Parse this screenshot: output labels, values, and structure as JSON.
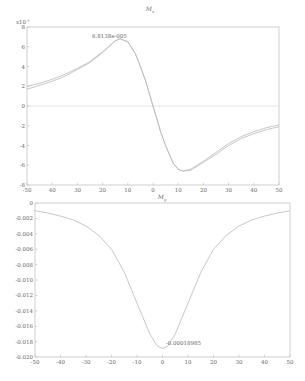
{
  "chart_data": [
    {
      "type": "line",
      "title": "M_x",
      "xlabel": "",
      "ylabel": "",
      "y_scale_label": "x10^-5",
      "xlim": [
        -50,
        50
      ],
      "ylim": [
        -8,
        8
      ],
      "x_ticks": [
        -50,
        -40,
        -30,
        -20,
        -10,
        0,
        10,
        20,
        30,
        40,
        50
      ],
      "x_tick_labels": [
        "-50",
        "40",
        "30",
        "20",
        "10",
        "0",
        "10",
        "20",
        "30",
        "40",
        "50"
      ],
      "y_ticks": [
        -8,
        -6,
        -4,
        -2,
        0,
        2,
        4,
        6,
        8
      ],
      "grid": false,
      "zero_line": true,
      "annotation": {
        "text": "6.8138e-005",
        "x": -13,
        "y": 6.8138
      },
      "series": [
        {
          "name": "curve-1",
          "x": [
            -50,
            -45,
            -40,
            -35,
            -30,
            -25,
            -20,
            -15,
            -13,
            -10,
            -7,
            -5,
            -3,
            0,
            3,
            5,
            8,
            10,
            12,
            15,
            20,
            25,
            30,
            35,
            40,
            45,
            50
          ],
          "values": [
            2.0,
            2.3,
            2.7,
            3.2,
            3.8,
            4.5,
            5.5,
            6.6,
            6.81,
            6.5,
            5.3,
            4.0,
            2.6,
            0.0,
            -2.6,
            -4.0,
            -5.8,
            -6.4,
            -6.6,
            -6.4,
            -5.6,
            -4.7,
            -3.8,
            -3.1,
            -2.6,
            -2.2,
            -1.9
          ]
        },
        {
          "name": "curve-2",
          "x": [
            -50,
            -45,
            -40,
            -35,
            -30,
            -25,
            -20,
            -15,
            -13,
            -10,
            -7,
            -5,
            -3,
            0,
            3,
            5,
            8,
            10,
            12,
            15,
            20,
            25,
            30,
            35,
            40,
            45,
            50
          ],
          "values": [
            1.7,
            2.1,
            2.5,
            3.0,
            3.7,
            4.4,
            5.4,
            6.6,
            6.81,
            6.5,
            5.3,
            4.0,
            2.6,
            0.0,
            -2.6,
            -4.0,
            -5.8,
            -6.4,
            -6.6,
            -6.5,
            -5.7,
            -4.9,
            -4.0,
            -3.3,
            -2.8,
            -2.4,
            -2.1
          ]
        }
      ]
    },
    {
      "type": "line",
      "title": "M_y",
      "xlabel": "",
      "ylabel": "",
      "xlim": [
        -50,
        50
      ],
      "ylim": [
        -0.02,
        0
      ],
      "x_ticks": [
        -50,
        -40,
        -30,
        -20,
        -10,
        0,
        10,
        20,
        30,
        40,
        50
      ],
      "x_tick_labels": [
        "-50",
        "-40",
        "-30",
        "-20",
        "-10",
        "0",
        "10",
        "20",
        "30",
        "40",
        "50"
      ],
      "y_ticks": [
        0,
        -0.002,
        -0.004,
        -0.006,
        -0.008,
        -0.01,
        -0.012,
        -0.014,
        -0.016,
        -0.018,
        -0.02
      ],
      "y_tick_labels": [
        "0",
        "-0.002",
        "-0.004",
        "-0.006",
        "-0.008",
        "-0.010",
        "-0.012",
        "-0.014",
        "-0.016",
        "-0.018",
        "-0.020"
      ],
      "grid": false,
      "annotation": {
        "text": "-0.00018985",
        "x": 0,
        "y": -0.0189
      },
      "series": [
        {
          "name": "curve-1",
          "x": [
            -50,
            -45,
            -40,
            -35,
            -30,
            -25,
            -20,
            -15,
            -10,
            -5,
            -2,
            0,
            2,
            5,
            10,
            15,
            20,
            25,
            30,
            35,
            40,
            45,
            50
          ],
          "values": [
            -0.001,
            -0.0013,
            -0.0017,
            -0.0022,
            -0.003,
            -0.0042,
            -0.006,
            -0.009,
            -0.013,
            -0.017,
            -0.0186,
            -0.0189,
            -0.0186,
            -0.017,
            -0.013,
            -0.009,
            -0.006,
            -0.0042,
            -0.003,
            -0.0022,
            -0.0017,
            -0.0013,
            -0.001
          ]
        }
      ]
    }
  ],
  "plots": {
    "top": {
      "title_main": "M",
      "title_sub": "x",
      "scale_label": "x10",
      "scale_exp": "-5",
      "annotation": "6.8138e-005",
      "y_tick_labels": [
        "8",
        "6",
        "4",
        "2",
        "0",
        "-2",
        "-4",
        "-6",
        "-8"
      ],
      "x_tick_labels": [
        "-50",
        "40",
        "30",
        "20",
        "10",
        "0",
        "10",
        "20",
        "30",
        "40",
        "50"
      ]
    },
    "bottom": {
      "title_main": "M",
      "title_sub": "y",
      "annotation": "-0.00018985",
      "y_tick_labels": [
        "0",
        "-0.002",
        "-0.004",
        "-0.006",
        "-0.008",
        "-0.010",
        "-0.012",
        "-0.014",
        "-0.016",
        "-0.018",
        "-0.020"
      ],
      "x_tick_labels": [
        "-50",
        "-40",
        "-30",
        "-20",
        "-10",
        "0",
        "10",
        "20",
        "30",
        "40",
        "50"
      ]
    }
  },
  "colors": {
    "curve": "#b9b9b9",
    "axis": "#b0b0b0",
    "text": "#666666"
  }
}
